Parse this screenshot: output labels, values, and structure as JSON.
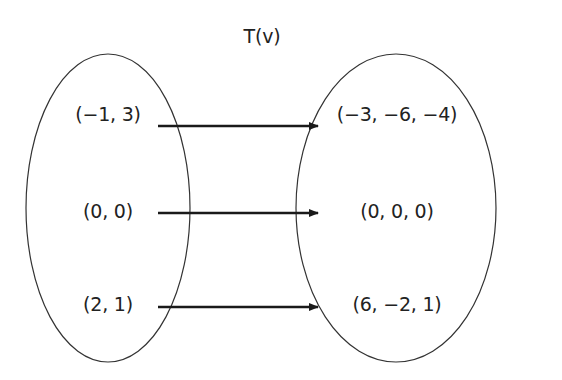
{
  "title": "T(v)",
  "domain_set": {
    "items": [
      {
        "label": "(−1, 3)"
      },
      {
        "label": "(0, 0)"
      },
      {
        "label": "(2, 1)"
      }
    ]
  },
  "codomain_set": {
    "items": [
      {
        "label": "(−3, −6, −4)"
      },
      {
        "label": "(0, 0, 0)"
      },
      {
        "label": "(6, −2, 1)"
      }
    ]
  },
  "mappings": [
    {
      "from": "(−1, 3)",
      "to": "(−3, −6, −4)"
    },
    {
      "from": "(0, 0)",
      "to": "(0, 0, 0)"
    },
    {
      "from": "(2, 1)",
      "to": "(6, −2, 1)"
    }
  ],
  "colors": {
    "stroke": "#222222",
    "text": "#222222"
  }
}
